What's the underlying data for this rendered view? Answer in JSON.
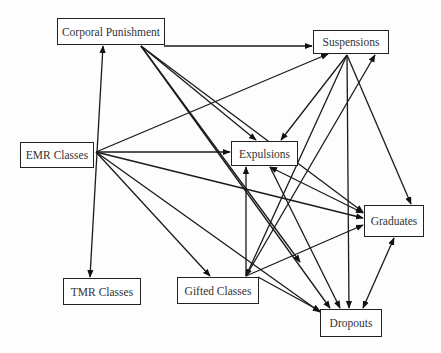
{
  "diagram": {
    "type": "directed-graph",
    "nodes": [
      {
        "id": "corporal",
        "label": "Corporal Punishment",
        "x": 57,
        "y": 18,
        "w": 108,
        "h": 27
      },
      {
        "id": "suspensions",
        "label": "Suspensions",
        "x": 313,
        "y": 30,
        "w": 76,
        "h": 24
      },
      {
        "id": "emr",
        "label": "EMR Classes",
        "x": 20,
        "y": 142,
        "w": 74,
        "h": 26
      },
      {
        "id": "expulsions",
        "label": "Expulsions",
        "x": 231,
        "y": 141,
        "w": 67,
        "h": 25
      },
      {
        "id": "graduates",
        "label": "Graduates",
        "x": 364,
        "y": 205,
        "w": 60,
        "h": 32
      },
      {
        "id": "tmr",
        "label": "TMR Classes",
        "x": 63,
        "y": 278,
        "w": 78,
        "h": 27
      },
      {
        "id": "gifted",
        "label": "Gifted Classes",
        "x": 177,
        "y": 277,
        "w": 82,
        "h": 27
      },
      {
        "id": "dropouts",
        "label": "Dropouts",
        "x": 320,
        "y": 309,
        "w": 62,
        "h": 28
      }
    ],
    "edges": [
      {
        "from": "corporal",
        "to": "suspensions",
        "x1": 164,
        "y1": 46,
        "x2": 312,
        "y2": 46
      },
      {
        "from": "corporal",
        "to": "expulsions",
        "x1": 141,
        "y1": 46,
        "x2": 256,
        "y2": 140
      },
      {
        "from": "corporal",
        "to": "graduates",
        "x1": 141,
        "y1": 46,
        "x2": 363,
        "y2": 212
      },
      {
        "from": "corporal",
        "to": "dropouts",
        "x1": 141,
        "y1": 46,
        "x2": 330,
        "y2": 308
      },
      {
        "from": "corporal",
        "to": "gifted-dropouts",
        "x1": 141,
        "y1": 46,
        "x2": 300,
        "y2": 262
      },
      {
        "from": "tmr",
        "to": "corporal",
        "x1": 90,
        "y1": 277,
        "x2": 103,
        "y2": 46,
        "both": true
      },
      {
        "from": "emr",
        "to": "suspensions",
        "x1": 96,
        "y1": 152,
        "x2": 328,
        "y2": 54
      },
      {
        "from": "emr",
        "to": "expulsions",
        "x1": 96,
        "y1": 152,
        "x2": 230,
        "y2": 152
      },
      {
        "from": "emr",
        "to": "graduates",
        "x1": 96,
        "y1": 152,
        "x2": 363,
        "y2": 218
      },
      {
        "from": "emr",
        "to": "gifted",
        "x1": 96,
        "y1": 152,
        "x2": 210,
        "y2": 276
      },
      {
        "from": "emr",
        "to": "dropouts",
        "x1": 96,
        "y1": 152,
        "x2": 320,
        "y2": 312
      },
      {
        "from": "suspensions",
        "to": "expulsions",
        "x1": 347,
        "y1": 55,
        "x2": 281,
        "y2": 140
      },
      {
        "from": "suspensions",
        "to": "graduates",
        "x1": 347,
        "y1": 55,
        "x2": 411,
        "y2": 204
      },
      {
        "from": "suspensions",
        "to": "dropouts",
        "x1": 347,
        "y1": 55,
        "x2": 349,
        "y2": 308
      },
      {
        "from": "suspensions",
        "to": "gifted",
        "x1": 347,
        "y1": 55,
        "x2": 246,
        "y2": 276
      },
      {
        "from": "gifted",
        "to": "suspensions",
        "x1": 246,
        "y1": 276,
        "x2": 375,
        "y2": 55
      },
      {
        "from": "gifted",
        "to": "expulsions",
        "x1": 246,
        "y1": 276,
        "x2": 246,
        "y2": 167
      },
      {
        "from": "gifted",
        "to": "graduates",
        "x1": 246,
        "y1": 276,
        "x2": 363,
        "y2": 225
      },
      {
        "from": "gifted",
        "to": "dropouts",
        "x1": 258,
        "y1": 277,
        "x2": 320,
        "y2": 311
      },
      {
        "from": "expulsions",
        "to": "graduates",
        "x1": 270,
        "y1": 167,
        "x2": 363,
        "y2": 213,
        "both": true
      },
      {
        "from": "expulsions",
        "to": "dropouts",
        "x1": 270,
        "y1": 167,
        "x2": 340,
        "y2": 308
      },
      {
        "from": "graduates",
        "to": "dropouts",
        "x1": 394,
        "y1": 238,
        "x2": 363,
        "y2": 308,
        "both": true
      }
    ]
  }
}
